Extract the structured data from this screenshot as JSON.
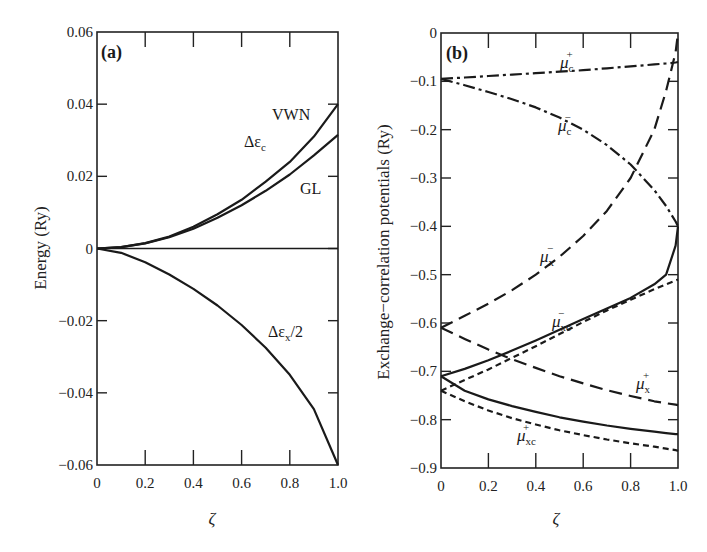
{
  "chart_data": [
    {
      "type": "line",
      "panel": "(a)",
      "title": "",
      "xlabel": "ζ",
      "ylabel": "Energy (Ry)",
      "xlim": [
        0,
        1.0
      ],
      "ylim": [
        -0.06,
        0.06
      ],
      "xticks": [
        "0",
        "0.2",
        "0.4",
        "0.6",
        "0.8",
        "1.0"
      ],
      "yticks": [
        "-0.06",
        "-0.04",
        "-0.02",
        "0",
        "0.02",
        "0.04",
        "0.06"
      ],
      "grid": false,
      "x": [
        0,
        0.1,
        0.2,
        0.3,
        0.4,
        0.5,
        0.6,
        0.7,
        0.8,
        0.9,
        1.0
      ],
      "series": [
        {
          "name": "VWN",
          "group": "Δε_c",
          "style": "solid",
          "values": [
            0,
            0.0004,
            0.0015,
            0.0033,
            0.006,
            0.0095,
            0.0135,
            0.0185,
            0.024,
            0.031,
            0.04
          ]
        },
        {
          "name": "GL",
          "group": "Δε_c",
          "style": "solid",
          "values": [
            0,
            0.0004,
            0.0014,
            0.0031,
            0.0055,
            0.0085,
            0.012,
            0.016,
            0.0205,
            0.0258,
            0.0315
          ]
        },
        {
          "name": "Δε_x/2",
          "style": "solid",
          "values": [
            0,
            -0.0012,
            -0.0038,
            -0.0072,
            -0.0112,
            -0.0158,
            -0.0212,
            -0.0275,
            -0.035,
            -0.0445,
            -0.06
          ]
        },
        {
          "name": "zero",
          "style": "solid",
          "values": [
            0,
            0,
            0,
            0,
            0,
            0,
            0,
            0,
            0,
            0,
            0
          ]
        }
      ],
      "annotations": [
        "(a)",
        "VWN",
        "Δε_c",
        "GL",
        "Δε_x/2"
      ]
    },
    {
      "type": "line",
      "panel": "(b)",
      "title": "",
      "xlabel": "ζ",
      "ylabel": "Exchange–correlation potentials (Ry)",
      "xlim": [
        0,
        1.0
      ],
      "ylim": [
        -0.9,
        0
      ],
      "xticks": [
        "0",
        "0.2",
        "0.4",
        "0.6",
        "0.8",
        "1.0"
      ],
      "yticks": [
        "0",
        "-0.1",
        "-0.2",
        "-0.3",
        "-0.4",
        "-0.5",
        "-0.6",
        "-0.7",
        "-0.8",
        "-0.9"
      ],
      "grid": false,
      "x": [
        0,
        0.1,
        0.2,
        0.3,
        0.4,
        0.5,
        0.6,
        0.7,
        0.8,
        0.9,
        0.95,
        0.99,
        1.0
      ],
      "series": [
        {
          "name": "μ_c^+",
          "style": "dashdot",
          "values": [
            -0.095,
            -0.092,
            -0.089,
            -0.086,
            -0.083,
            -0.08,
            -0.077,
            -0.073,
            -0.069,
            -0.065,
            -0.063,
            -0.061,
            -0.06
          ]
        },
        {
          "name": "μ_c^-",
          "style": "dashdot",
          "values": [
            -0.095,
            -0.108,
            -0.122,
            -0.137,
            -0.154,
            -0.175,
            -0.2,
            -0.232,
            -0.272,
            -0.325,
            -0.358,
            -0.39,
            -0.4
          ]
        },
        {
          "name": "μ_x^-",
          "style": "longdash",
          "values": [
            -0.61,
            -0.585,
            -0.56,
            -0.532,
            -0.5,
            -0.463,
            -0.42,
            -0.368,
            -0.3,
            -0.2,
            -0.12,
            -0.04,
            0.0
          ]
        },
        {
          "name": "μ_x^+",
          "style": "longdash",
          "values": [
            -0.61,
            -0.633,
            -0.655,
            -0.675,
            -0.693,
            -0.71,
            -0.725,
            -0.739,
            -0.751,
            -0.762,
            -0.766,
            -0.769,
            -0.77
          ]
        },
        {
          "name": "μ_xc^-",
          "style": "solid",
          "values": [
            -0.71,
            -0.695,
            -0.677,
            -0.657,
            -0.636,
            -0.614,
            -0.592,
            -0.57,
            -0.548,
            -0.52,
            -0.5,
            -0.44,
            -0.4
          ]
        },
        {
          "name": "μ_xc^+",
          "style": "solid",
          "values": [
            -0.71,
            -0.74,
            -0.758,
            -0.772,
            -0.784,
            -0.795,
            -0.804,
            -0.812,
            -0.819,
            -0.825,
            -0.828,
            -0.83,
            -0.83
          ]
        },
        {
          "name": "μ_x^- + μ_c^- (short dash upper)",
          "style": "shortdash",
          "values": [
            -0.74,
            -0.718,
            -0.696,
            -0.672,
            -0.648,
            -0.623,
            -0.598,
            -0.574,
            -0.552,
            -0.53,
            -0.52,
            -0.512,
            -0.51
          ]
        },
        {
          "name": "μ_x^+ + μ_c^+ (short dash lower)",
          "style": "shortdash",
          "values": [
            -0.74,
            -0.762,
            -0.781,
            -0.797,
            -0.81,
            -0.822,
            -0.832,
            -0.841,
            -0.849,
            -0.856,
            -0.86,
            -0.863,
            -0.865
          ]
        }
      ],
      "annotations": [
        "(b)",
        "μ_c^+",
        "μ_c^-",
        "μ_x^-",
        "μ_xc^-",
        "μ_x^+",
        "μ_xc^+"
      ]
    }
  ],
  "labels": {
    "a": {
      "panel": "(a)",
      "ylabel": "Energy (Ry)",
      "xlabel": "ζ",
      "vwn": "VWN",
      "gl": "GL",
      "de_c_main": "Δε",
      "de_c_sub": "c",
      "de_x_main": "Δε",
      "de_x_sub": "x",
      "de_x_tail": "/2"
    },
    "b": {
      "panel": "(b)",
      "ylabel": "Exchange−correlation potentials (Ry)",
      "xlabel": "ζ",
      "mu": "μ",
      "c_plus_sub": "c",
      "c_plus_sup": "+",
      "c_minus_sub": "c",
      "c_minus_sup": "−",
      "x_minus_sub": "x",
      "x_minus_sup": "−",
      "xc_minus_sub": "xc",
      "xc_minus_sup": "−",
      "x_plus_sub": "x",
      "x_plus_sup": "+",
      "xc_plus_sub": "xc",
      "xc_plus_sup": "+"
    }
  }
}
